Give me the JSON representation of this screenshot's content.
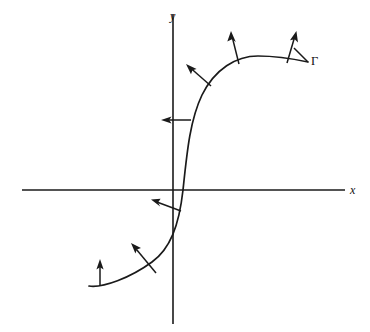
{
  "figure": {
    "type": "math-diagram",
    "width": 370,
    "height": 332,
    "background_color": "#ffffff",
    "ink_color": "#1a1a1a"
  },
  "axes": {
    "x_axis": {
      "label": "x",
      "label_position": {
        "x": 350,
        "y": 184
      },
      "line": {
        "x1": 22,
        "y1": 190,
        "x2": 345,
        "y2": 190
      }
    },
    "y_axis": {
      "label": "y",
      "label_position": {
        "x": 170,
        "y": 10
      },
      "line": {
        "x1": 173,
        "y1": 14,
        "x2": 173,
        "y2": 324
      }
    },
    "origin": {
      "x": 173,
      "y": 190
    }
  },
  "curve": {
    "name": "gamma-curve",
    "label": "Γ",
    "label_position": {
      "x": 311,
      "y": 55
    },
    "stroke_width": 1.7,
    "path": "M 89 286 C 103 288 130 278 152 262 C 170 249 179 226 183 190 C 187 152 190 120 202 95 C 215 69 236 56 258 56 C 276 56 294 59 308 62",
    "endpoints": {
      "left": {
        "x": 89,
        "y": 286
      },
      "right": {
        "x": 308,
        "y": 62
      }
    },
    "x_axis_crossing": {
      "x": 183,
      "y": 190
    }
  },
  "normal_vectors": [
    {
      "id": "vector-1",
      "description": "vertical arrow at far left end of curve",
      "tail": {
        "x": 100,
        "y": 286
      },
      "tip": {
        "x": 100,
        "y": 261
      }
    },
    {
      "id": "vector-2",
      "description": "arrow pointing up-left on lower-left branch",
      "tail": {
        "x": 156,
        "y": 273
      },
      "tip": {
        "x": 132,
        "y": 244
      }
    },
    {
      "id": "vector-3",
      "description": "arrow pointing left near origin below x-axis",
      "tail": {
        "x": 181,
        "y": 211
      },
      "tip": {
        "x": 152,
        "y": 200
      }
    },
    {
      "id": "vector-4",
      "description": "horizontal arrow pointing left crossing y-axis",
      "tail": {
        "x": 191,
        "y": 120
      },
      "tip": {
        "x": 162,
        "y": 120
      }
    },
    {
      "id": "vector-5",
      "description": "arrow pointing up-left on upper-left bend",
      "tail": {
        "x": 211,
        "y": 86
      },
      "tip": {
        "x": 187,
        "y": 65
      }
    },
    {
      "id": "vector-6",
      "description": "arrow pointing up on left shoulder of crest",
      "tail": {
        "x": 239,
        "y": 64
      },
      "tip": {
        "x": 231,
        "y": 32
      }
    },
    {
      "id": "vector-7",
      "description": "arrow pointing up-right on right shoulder of crest",
      "tail": {
        "x": 287,
        "y": 63
      },
      "tip": {
        "x": 296,
        "y": 32
      }
    }
  ],
  "leader_line": {
    "description": "short leader from curve to Gamma label",
    "x1": 294,
    "y1": 48,
    "x2": 308,
    "y2": 62
  }
}
